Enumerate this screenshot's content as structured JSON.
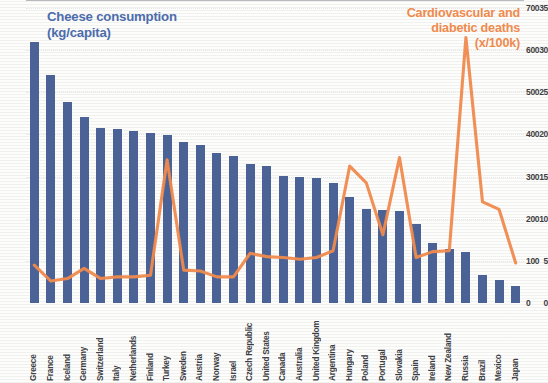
{
  "chart_data": {
    "type": "bar",
    "title": "",
    "series_titles": {
      "bars": "Cheese consumption\n(kg/capita)",
      "line": "Cardiovascular and\ndiabetic deaths\n(x/100k)"
    },
    "categories": [
      "Greece",
      "France",
      "Iceland",
      "Germany",
      "Switzerland",
      "Italy",
      "Netherlands",
      "Finland",
      "Turkey",
      "Sweden",
      "Austria",
      "Norway",
      "Israel",
      "Czech Republic",
      "United States",
      "Canada",
      "Australia",
      "United Kingdom",
      "Argentina",
      "Hungary",
      "Poland",
      "Portugal",
      "Slovakia",
      "Spain",
      "Ireland",
      "New Zealand",
      "Russia",
      "Brazil",
      "Mexico",
      "Japan"
    ],
    "series": [
      {
        "name": "Cheese consumption (kg/capita)",
        "type": "bar",
        "axis": "left",
        "color": "#4a6296",
        "values": [
          31.0,
          27.0,
          23.8,
          22.1,
          20.8,
          20.7,
          20.4,
          20.2,
          19.9,
          19.1,
          18.8,
          17.8,
          17.5,
          16.5,
          16.3,
          15.1,
          14.9,
          14.8,
          14.2,
          12.6,
          11.2,
          11.0,
          10.9,
          9.4,
          7.1,
          6.4,
          6.0,
          3.3,
          2.7,
          2.0
        ]
      },
      {
        "name": "Cardiovascular and diabetic deaths (x/100k)",
        "type": "line",
        "axis": "right",
        "color": "#ef8a4d",
        "values": [
          90,
          52,
          58,
          82,
          58,
          62,
          62,
          66,
          340,
          78,
          76,
          62,
          62,
          118,
          110,
          108,
          104,
          108,
          124,
          325,
          285,
          162,
          345,
          108,
          122,
          124,
          630,
          240,
          222,
          95
        ]
      }
    ],
    "xlabel": "",
    "ylabel_left": "Cheese consumption (kg/capita)",
    "ylabel_right": "Cardiovascular and diabetic deaths (x/100k)",
    "ylim_left": [
      0,
      35
    ],
    "ylim_right": [
      0,
      700
    ],
    "yticks_left": [
      0,
      5,
      10,
      15,
      20,
      25,
      30,
      35
    ],
    "yticks_right": [
      0,
      100,
      200,
      300,
      400,
      500,
      600,
      700
    ],
    "grid": true,
    "legend": "inline-titles"
  }
}
